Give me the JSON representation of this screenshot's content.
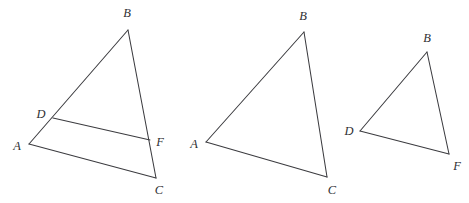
{
  "figure": {
    "kind": "geometry-diagram",
    "canvas": {
      "width": 469,
      "height": 203
    },
    "background_color": "#ffffff",
    "line_color": "#3b3b3f",
    "label_color": "#2f2f33",
    "label_font_style": "italic-serif",
    "shapes": [
      {
        "id": "triangle-1",
        "name": "triangle-abc-with-segment-df",
        "vertices": [
          {
            "label": "A",
            "x": 29,
            "y": 144,
            "label_x": 17,
            "label_y": 146
          },
          {
            "label": "B",
            "x": 128,
            "y": 30,
            "label_x": 127,
            "label_y": 13
          },
          {
            "label": "C",
            "x": 156,
            "y": 178,
            "label_x": 159,
            "label_y": 190
          },
          {
            "label": "D",
            "x": 53,
            "y": 118,
            "label_x": 41,
            "label_y": 114
          },
          {
            "label": "F",
            "x": 150,
            "y": 140,
            "label_x": 160,
            "label_y": 142
          }
        ],
        "edges": [
          {
            "name": "side-AB",
            "from": "A",
            "to": "B"
          },
          {
            "name": "side-BC",
            "from": "B",
            "to": "C"
          },
          {
            "name": "side-CA",
            "from": "C",
            "to": "A"
          },
          {
            "name": "segment-DF",
            "from": "D",
            "to": "F"
          }
        ]
      },
      {
        "id": "triangle-2",
        "name": "triangle-abc",
        "vertices": [
          {
            "label": "A",
            "x": 206,
            "y": 142,
            "label_x": 194,
            "label_y": 144
          },
          {
            "label": "B",
            "x": 304,
            "y": 32,
            "label_x": 303,
            "label_y": 16
          },
          {
            "label": "C",
            "x": 327,
            "y": 177,
            "label_x": 332,
            "label_y": 190
          }
        ],
        "edges": [
          {
            "name": "side-AB",
            "from": "A",
            "to": "B"
          },
          {
            "name": "side-BC",
            "from": "B",
            "to": "C"
          },
          {
            "name": "side-CA",
            "from": "C",
            "to": "A"
          }
        ]
      },
      {
        "id": "triangle-3",
        "name": "triangle-dbf",
        "vertices": [
          {
            "label": "D",
            "x": 360,
            "y": 131,
            "label_x": 349,
            "label_y": 131
          },
          {
            "label": "B",
            "x": 427,
            "y": 52,
            "label_x": 427,
            "label_y": 38
          },
          {
            "label": "F",
            "x": 449,
            "y": 154,
            "label_x": 457,
            "label_y": 166
          }
        ],
        "edges": [
          {
            "name": "side-DB",
            "from": "D",
            "to": "B"
          },
          {
            "name": "side-BF",
            "from": "B",
            "to": "F"
          },
          {
            "name": "side-FD",
            "from": "F",
            "to": "D"
          }
        ]
      }
    ]
  }
}
